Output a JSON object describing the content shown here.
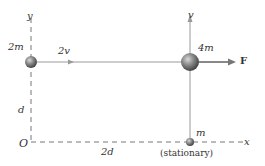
{
  "diagram": {
    "axes": {
      "x_label": "x",
      "y_label": "y",
      "origin_label": "O"
    },
    "particles": [
      {
        "label": "2m",
        "velocity_label": "2v"
      },
      {
        "label": "4m",
        "velocity_label": "v",
        "force_label": "F"
      },
      {
        "label": "m",
        "note": "(stationary)"
      }
    ],
    "dimensions": {
      "vertical": "d",
      "horizontal": "2d"
    },
    "colors": {
      "axis": "#777777",
      "line": "#9a9a9a",
      "arrow": "#888888",
      "ball": "#6e6e6e"
    }
  }
}
